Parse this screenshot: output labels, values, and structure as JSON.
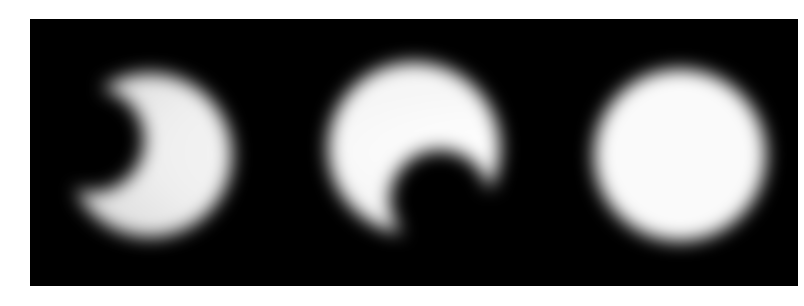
{
  "figure": {
    "background": "#ffffff",
    "panel_color": "#000000",
    "glow_color": "#ffffff",
    "frames": [
      {
        "id": "frame-1",
        "shape": "crescent-left-bite",
        "cx": 150,
        "cy": 155,
        "r": 82
      },
      {
        "id": "frame-2",
        "shape": "crescent-bottom-bite",
        "cx": 414,
        "cy": 148,
        "r": 86
      },
      {
        "id": "frame-3",
        "shape": "full-disc",
        "cx": 680,
        "cy": 155,
        "r": 88
      }
    ]
  }
}
